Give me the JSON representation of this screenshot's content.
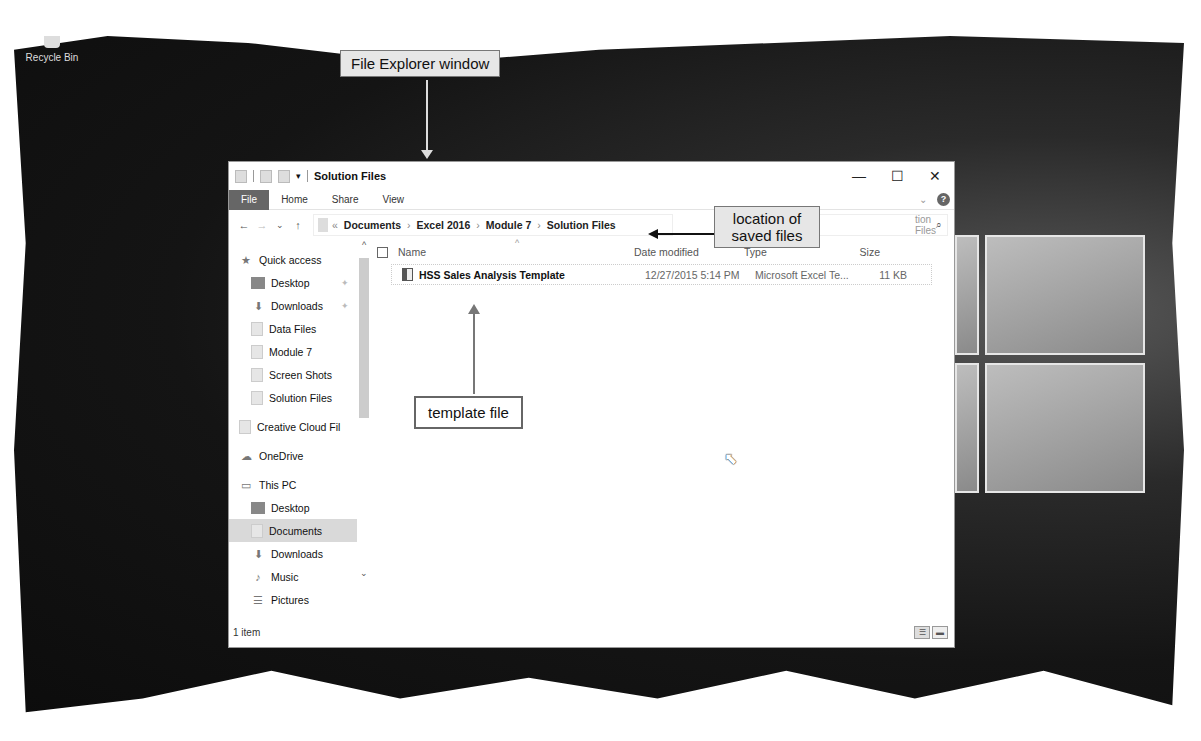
{
  "desktop": {
    "recycle_bin_label": "Recycle Bin"
  },
  "callouts": {
    "window": "File Explorer window",
    "location": "location of saved files",
    "template": "template file"
  },
  "window": {
    "title": "Solution Files",
    "controls": {
      "minimize": "—",
      "maximize": "☐",
      "close": "✕"
    },
    "ribbon_tabs": [
      "File",
      "Home",
      "Share",
      "View"
    ],
    "help": "?",
    "expand_ribbon": "⌄",
    "nav": {
      "back": "←",
      "forward": "→",
      "recent": "⌄",
      "up": "↑"
    },
    "address": {
      "overflow": "«",
      "crumbs": [
        "Documents",
        "Excel 2016",
        "Module 7",
        "Solution Files"
      ],
      "separator": "›"
    },
    "search": {
      "placeholder": "Search Solution Files",
      "visible_text": "tion Files",
      "icon": "⌕"
    },
    "navpane": {
      "quick_access": "Quick access",
      "quick_items": [
        {
          "label": "Desktop",
          "icon": "desktop-icon",
          "pinned": true
        },
        {
          "label": "Downloads",
          "icon": "download-icon",
          "pinned": true
        },
        {
          "label": "Data Files",
          "icon": "folder-icon"
        },
        {
          "label": "Module 7",
          "icon": "folder-icon"
        },
        {
          "label": "Screen Shots",
          "icon": "folder-icon"
        },
        {
          "label": "Solution Files",
          "icon": "folder-icon"
        }
      ],
      "creative_cloud": "Creative Cloud Fil",
      "onedrive": "OneDrive",
      "this_pc": "This PC",
      "pc_items": [
        {
          "label": "Desktop",
          "icon": "desktop-icon"
        },
        {
          "label": "Documents",
          "icon": "documents-icon",
          "selected": true
        },
        {
          "label": "Downloads",
          "icon": "download-icon"
        },
        {
          "label": "Music",
          "icon": "music-icon"
        },
        {
          "label": "Pictures",
          "icon": "pictures-icon"
        }
      ]
    },
    "columns": {
      "name": "Name",
      "date": "Date modified",
      "type": "Type",
      "size": "Size"
    },
    "files": [
      {
        "name": "HSS Sales Analysis Template",
        "date": "12/27/2015 5:14 PM",
        "type": "Microsoft Excel Te...",
        "size": "11 KB"
      }
    ],
    "status": "1 item"
  }
}
